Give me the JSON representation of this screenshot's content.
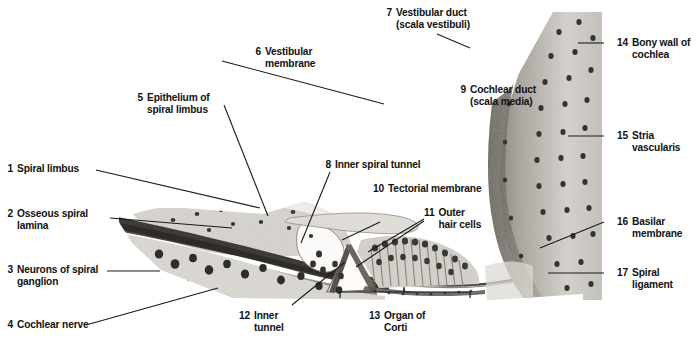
{
  "figure": {
    "kind": "histology-micrograph",
    "image_tone": "grayscale",
    "width": 697,
    "height": 347
  },
  "colors": {
    "background": "#ffffff",
    "text": "#111111",
    "leader_line": "#1a1a1a",
    "tissue_light": "#e4e2de",
    "tissue_mid": "#b9b5ae",
    "tissue_dark": "#6d6962",
    "tissue_darkest": "#3a3833",
    "nucleus": "#2e2c28"
  },
  "labels": [
    {
      "id": 1,
      "num": "1",
      "lines": [
        "Spiral limbus"
      ],
      "side": "left"
    },
    {
      "id": 2,
      "num": "2",
      "lines": [
        "Osseous spiral",
        "lamina"
      ],
      "side": "left"
    },
    {
      "id": 3,
      "num": "3",
      "lines": [
        "Neurons of spiral",
        "ganglion"
      ],
      "side": "left"
    },
    {
      "id": 4,
      "num": "4",
      "lines": [
        "Cochlear nerve"
      ],
      "side": "left"
    },
    {
      "id": 5,
      "num": "5",
      "lines": [
        "Epithelium of",
        "spiral limbus"
      ],
      "side": "left"
    },
    {
      "id": 6,
      "num": "6",
      "lines": [
        "Vestibular",
        "membrane"
      ],
      "side": "left"
    },
    {
      "id": 7,
      "num": "7",
      "lines": [
        "Vestibular duct",
        "(scala vestibuli)"
      ],
      "side": "top"
    },
    {
      "id": 8,
      "num": "8",
      "lines": [
        "Inner spiral tunnel"
      ],
      "side": "mid"
    },
    {
      "id": 9,
      "num": "9",
      "lines": [
        "Cochlear duct",
        "(scala media)"
      ],
      "side": "top"
    },
    {
      "id": 10,
      "num": "10",
      "lines": [
        "Tectorial membrane"
      ],
      "side": "mid"
    },
    {
      "id": 11,
      "num": "11",
      "lines": [
        "Outer",
        "hair cells"
      ],
      "side": "mid"
    },
    {
      "id": 12,
      "num": "12",
      "lines": [
        "Inner",
        "tunnel"
      ],
      "side": "bottom"
    },
    {
      "id": 13,
      "num": "13",
      "lines": [
        "Organ of",
        "Corti"
      ],
      "side": "bottom"
    },
    {
      "id": 14,
      "num": "14",
      "lines": [
        "Bony wall of",
        "cochlea"
      ],
      "side": "right"
    },
    {
      "id": 15,
      "num": "15",
      "lines": [
        "Stria",
        "vascularis"
      ],
      "side": "right"
    },
    {
      "id": 16,
      "num": "16",
      "lines": [
        "Basilar",
        "membrane"
      ],
      "side": "right"
    },
    {
      "id": 17,
      "num": "17",
      "lines": [
        "Spiral",
        "ligament"
      ],
      "side": "right"
    }
  ],
  "bracket": {
    "for_label": "13",
    "caption": "Organ of Corti",
    "x_start": 340,
    "x_end": 470,
    "y": 296
  }
}
